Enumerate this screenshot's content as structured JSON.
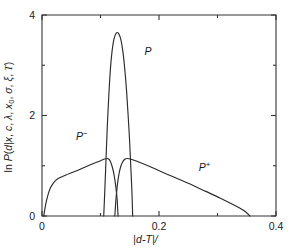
{
  "chart_data": {
    "type": "line",
    "title": "",
    "xlabel": "|d-T|/l",
    "ylabel": "ln P(d|x, c, λ, x0, σ, ξ, T)",
    "xlim": [
      0,
      0.4
    ],
    "ylim": [
      0,
      4
    ],
    "xticks": [
      "0",
      "0.2",
      "0.4"
    ],
    "xtick_values": [
      0,
      0.2,
      0.4
    ],
    "xminor_values": [
      0.1,
      0.3
    ],
    "yticks": [
      "0",
      "2",
      "4"
    ],
    "ytick_values": [
      0,
      2,
      4
    ],
    "yminor_values": [
      1,
      3
    ],
    "grid": false,
    "legend": "inline-annotations",
    "series": [
      {
        "name": "P",
        "label": "P",
        "label_x": 0.175,
        "label_y": 3.2,
        "points": [
          [
            0.1055,
            0.0
          ],
          [
            0.1075,
            0.55
          ],
          [
            0.1095,
            1.15
          ],
          [
            0.1115,
            1.75
          ],
          [
            0.114,
            2.35
          ],
          [
            0.1165,
            2.85
          ],
          [
            0.1195,
            3.25
          ],
          [
            0.123,
            3.52
          ],
          [
            0.127,
            3.64
          ],
          [
            0.131,
            3.63
          ],
          [
            0.135,
            3.5
          ],
          [
            0.1385,
            3.25
          ],
          [
            0.1415,
            2.92
          ],
          [
            0.1445,
            2.5
          ],
          [
            0.147,
            2.05
          ],
          [
            0.1495,
            1.55
          ],
          [
            0.1515,
            1.05
          ],
          [
            0.1535,
            0.55
          ],
          [
            0.155,
            0.0
          ]
        ]
      },
      {
        "name": "P-",
        "label": "P⁻",
        "label_x": 0.058,
        "label_y": 1.52,
        "points": [
          [
            0.003,
            0.0
          ],
          [
            0.0055,
            0.18
          ],
          [
            0.008,
            0.32
          ],
          [
            0.011,
            0.45
          ],
          [
            0.0145,
            0.56
          ],
          [
            0.0185,
            0.64
          ],
          [
            0.0235,
            0.71
          ],
          [
            0.03,
            0.76
          ],
          [
            0.038,
            0.8
          ],
          [
            0.047,
            0.845
          ],
          [
            0.057,
            0.89
          ],
          [
            0.068,
            0.945
          ],
          [
            0.079,
            1.0
          ],
          [
            0.09,
            1.055
          ],
          [
            0.1,
            1.1
          ],
          [
            0.107,
            1.135
          ],
          [
            0.111,
            1.145
          ],
          [
            0.1145,
            1.13
          ],
          [
            0.1175,
            1.07
          ],
          [
            0.1205,
            0.96
          ],
          [
            0.1235,
            0.8
          ],
          [
            0.1262,
            0.58
          ],
          [
            0.1285,
            0.32
          ],
          [
            0.13,
            0.0
          ]
        ]
      },
      {
        "name": "P+",
        "label": "P⁺",
        "label_x": 0.268,
        "label_y": 0.9,
        "points": [
          [
            0.1245,
            0.0
          ],
          [
            0.1262,
            0.3
          ],
          [
            0.1285,
            0.58
          ],
          [
            0.131,
            0.8
          ],
          [
            0.134,
            0.96
          ],
          [
            0.1375,
            1.07
          ],
          [
            0.1415,
            1.13
          ],
          [
            0.146,
            1.145
          ],
          [
            0.151,
            1.135
          ],
          [
            0.16,
            1.1
          ],
          [
            0.175,
            1.03
          ],
          [
            0.195,
            0.93
          ],
          [
            0.22,
            0.8
          ],
          [
            0.25,
            0.65
          ],
          [
            0.28,
            0.49
          ],
          [
            0.305,
            0.355
          ],
          [
            0.328,
            0.22
          ],
          [
            0.345,
            0.11
          ],
          [
            0.3555,
            0.0
          ]
        ]
      }
    ]
  },
  "axes": {
    "x_title_parts": {
      "bar1": "|",
      "d": "d",
      "minus": "-",
      "T": "T",
      "bar2": "|",
      "slash": "/"
    },
    "y_title_text": "ln P(d|x, c, λ, x0, σ, ξ, T)"
  }
}
